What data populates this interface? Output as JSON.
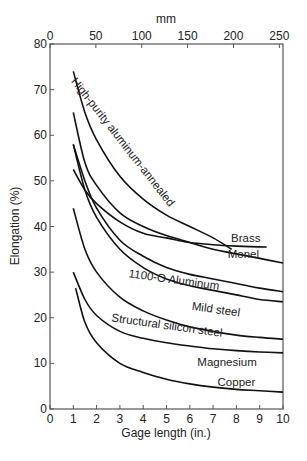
{
  "chart_data": {
    "type": "line",
    "title": "",
    "xlabel": "Gage length (in.)",
    "ylabel": "Elongation (%)",
    "x2label": "mm",
    "xlim": [
      0,
      10
    ],
    "ylim": [
      0,
      80
    ],
    "x2lim": [
      0,
      254
    ],
    "xticks": [
      0,
      1,
      2,
      3,
      4,
      5,
      6,
      7,
      8,
      9,
      10
    ],
    "yticks": [
      0,
      10,
      20,
      30,
      40,
      50,
      60,
      70,
      80
    ],
    "x2ticks": [
      0,
      50,
      100,
      150,
      200,
      250
    ],
    "grid": false,
    "legend": "inline labels",
    "series": [
      {
        "name": "High-purity aluminum-annealed",
        "x": [
          1.0,
          1.5,
          2,
          3,
          4,
          5,
          6,
          7,
          7.8
        ],
        "y": [
          74,
          65,
          59,
          51,
          46,
          42.5,
          40,
          37.5,
          35
        ]
      },
      {
        "name": "Brass",
        "x": [
          1.0,
          1.5,
          2,
          3,
          4,
          5,
          6,
          7,
          8,
          9.3
        ],
        "y": [
          52.5,
          48,
          45,
          41,
          38.5,
          37.5,
          36.5,
          36,
          35.7,
          35.5
        ]
      },
      {
        "name": "Monel",
        "x": [
          1.0,
          1.5,
          2,
          3,
          4,
          5,
          6,
          7,
          8,
          9,
          10
        ],
        "y": [
          65,
          54,
          49,
          43,
          40,
          38,
          36.5,
          35,
          34,
          33,
          32
        ]
      },
      {
        "name": "1100-O Aluminum",
        "x": [
          1.0,
          1.5,
          2,
          3,
          4,
          5,
          6,
          7,
          8,
          9,
          10
        ],
        "y": [
          58,
          50,
          44,
          37,
          33.5,
          31,
          29.5,
          28.5,
          27.5,
          26.5,
          25.7
        ]
      },
      {
        "name": "Mild steel",
        "x": [
          1.0,
          1.5,
          2,
          3,
          4,
          5,
          6,
          7,
          8,
          9,
          10
        ],
        "y": [
          58,
          48,
          42,
          35,
          31,
          28.5,
          27,
          26,
          25,
          24,
          23.5
        ]
      },
      {
        "name": "Structural silicon steel",
        "x": [
          1.0,
          1.5,
          2,
          3,
          4,
          5,
          6,
          7,
          8,
          9,
          10
        ],
        "y": [
          44,
          35,
          30,
          24.5,
          21.5,
          19.5,
          18,
          17,
          16.2,
          15.7,
          15.3
        ]
      },
      {
        "name": "Magnesium",
        "x": [
          1.0,
          1.5,
          2,
          3,
          4,
          5,
          6,
          7,
          8,
          9,
          10
        ],
        "y": [
          30,
          24,
          20.5,
          17,
          15.5,
          14.5,
          13.8,
          13.2,
          12.8,
          12.5,
          12.3
        ]
      },
      {
        "name": "Copper",
        "x": [
          1.1,
          1.5,
          2,
          3,
          4,
          5,
          6,
          7,
          8,
          9,
          10
        ],
        "y": [
          26.5,
          19,
          14.5,
          10,
          8,
          6.5,
          5.5,
          4.8,
          4.3,
          4,
          3.7
        ]
      }
    ],
    "labels": [
      {
        "text": "High-purity aluminum-annealed",
        "x": 3.0,
        "y": 58,
        "rotate": 52
      },
      {
        "text": "Brass",
        "x": 8.4,
        "y": 36.6,
        "rotate": 0
      },
      {
        "text": "Monel",
        "x": 8.3,
        "y": 33.2,
        "rotate": 0
      },
      {
        "text": "1100-O Aluminum",
        "x": 5.3,
        "y": 27.5,
        "rotate": 8
      },
      {
        "text": "Mild steel",
        "x": 7.1,
        "y": 21,
        "rotate": 8
      },
      {
        "text": "Structural silicon steel",
        "x": 5.0,
        "y": 17.5,
        "rotate": 8
      },
      {
        "text": "Magnesium",
        "x": 7.6,
        "y": 9.5,
        "rotate": 0
      },
      {
        "text": "Copper",
        "x": 8.0,
        "y": 5,
        "rotate": 0
      }
    ]
  }
}
